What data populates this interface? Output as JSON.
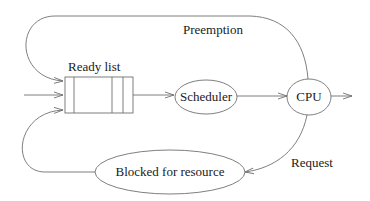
{
  "diagram": {
    "nodes": {
      "ready_list": {
        "label": "Ready list"
      },
      "scheduler": {
        "label": "Scheduler"
      },
      "cpu": {
        "label": "CPU"
      },
      "blocked": {
        "label": "Blocked for resource"
      }
    },
    "edges": {
      "preemption": {
        "label": "Preemption"
      },
      "request": {
        "label": "Request"
      }
    },
    "colors": {
      "stroke": "#707070",
      "text": "#1a1a1a",
      "background": "#ffffff"
    }
  }
}
